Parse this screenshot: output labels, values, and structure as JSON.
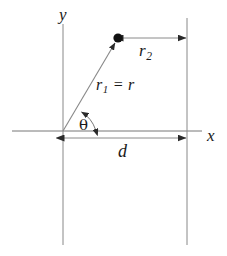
{
  "figure": {
    "type": "geometry-diagram",
    "background_color": "#ffffff",
    "stroke_color": "#555555",
    "ink_color": "#1a1a1a",
    "labels": {
      "y_axis": "y",
      "x_axis": "x",
      "r2": "r",
      "r2_subscript": "2",
      "r1": "r",
      "r1_subscript": "1",
      "equals": "=",
      "r_plain": "r",
      "theta": "θ",
      "d": "d"
    },
    "geometry": {
      "origin": {
        "x": 63,
        "y": 131
      },
      "point": {
        "x": 118,
        "y": 38,
        "radius": 4.5
      },
      "x_axis_line": {
        "x1": 12,
        "y1": 131,
        "x2": 202,
        "y2": 131
      },
      "y_axis_line": {
        "x1": 63,
        "y1": 24,
        "x2": 63,
        "y2": 245
      },
      "right_vertical_line": {
        "x1": 187,
        "y1": 18,
        "x2": 187,
        "y2": 245
      },
      "r1_segment": {
        "x1": 63,
        "y1": 131,
        "x2": 118,
        "y2": 38
      },
      "r2_dimension": {
        "x1": 122,
        "y1": 38,
        "x2": 186,
        "y2": 38
      },
      "d_dimension": {
        "x1": 64,
        "y1": 138,
        "x2": 186,
        "y2": 138
      },
      "theta_arc": {
        "start_x": 96,
        "start_y": 130,
        "end_x": 81,
        "end_y": 111,
        "radius": 33
      }
    },
    "label_positions": {
      "y": {
        "left": 59,
        "top": 7
      },
      "x": {
        "left": 207,
        "top": 128
      },
      "r2": {
        "left": 139,
        "top": 43
      },
      "r1_eq_r": {
        "left": 96,
        "top": 77
      },
      "theta": {
        "left": 79,
        "top": 119
      },
      "d": {
        "left": 118,
        "top": 143
      }
    }
  }
}
